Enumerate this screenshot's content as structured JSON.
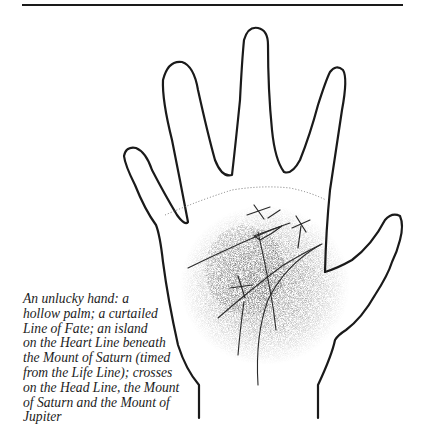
{
  "figure": {
    "caption_lines": [
      "An unlucky hand: a",
      "hollow palm; a curtailed",
      "Line of Fate; an island",
      "on the Heart Line beneath",
      "the Mount of Saturn (timed",
      "from the Life Line); crosses",
      "on the Head Line, the Mount",
      "of Saturn and the Mount of",
      "Jupiter"
    ]
  },
  "colors": {
    "ink": "#1a1a1a",
    "stipple": "#555555",
    "background": "#ffffff"
  }
}
